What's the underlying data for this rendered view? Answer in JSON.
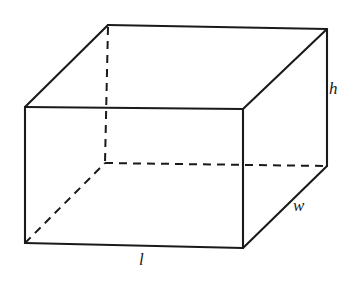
{
  "figure": {
    "name": "rectangular-prism-diagram",
    "background_color": "#ffffff",
    "stroke_color": "#1a1a1a",
    "labels": {
      "length": "l",
      "width": "w",
      "height": "h"
    },
    "label_positions": {
      "length": {
        "x": 144,
        "y": 260
      },
      "width": {
        "x": 298,
        "y": 205
      },
      "height": {
        "x": 333,
        "y": 88
      }
    },
    "vertices": {
      "front_top_left": {
        "x": 25,
        "y": 107
      },
      "front_top_right": {
        "x": 243,
        "y": 109
      },
      "front_bottom_right": {
        "x": 243,
        "y": 248
      },
      "front_bottom_left": {
        "x": 25,
        "y": 243
      },
      "back_top_left": {
        "x": 108,
        "y": 25
      },
      "back_top_right": {
        "x": 327,
        "y": 29
      },
      "back_bottom_right": {
        "x": 327,
        "y": 166
      },
      "back_bottom_left": {
        "x": 105,
        "y": 163
      }
    },
    "edges": {
      "solid": [
        "front-top",
        "front-right",
        "front-bottom",
        "front-left",
        "back-top",
        "back-right",
        "top-left-diagonal",
        "top-right-diagonal",
        "bottom-right-diagonal"
      ],
      "hidden": [
        "back-left-vertical",
        "back-bottom",
        "bottom-left-diagonal"
      ]
    }
  }
}
